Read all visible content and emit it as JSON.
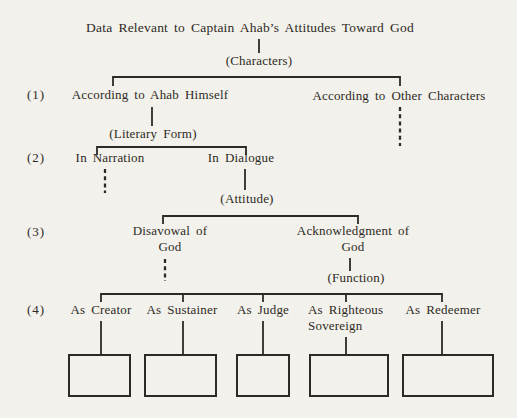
{
  "diagram": {
    "title": "Data Relevant to Captain Ahab’s Attitudes Toward God",
    "grouping_labels": {
      "characters": "(Characters)",
      "literary_form": "(Literary Form)",
      "attitude": "(Attitude)",
      "function": "(Function)"
    },
    "level_markers": [
      "(1)",
      "(2)",
      "(3)",
      "(4)"
    ],
    "level1": {
      "left": "According to Ahab Himself",
      "right": "According to Other Characters"
    },
    "level2": {
      "left": "In Narration",
      "right": "In Dialogue"
    },
    "level3": {
      "left": "Disavowal of God",
      "right": "Acknowledgment of God"
    },
    "level4": [
      "As Creator",
      "As Sustainer",
      "As Judge",
      "As Righteous Sovereign",
      "As Redeemer"
    ],
    "empty_box_count": 5,
    "colors": {
      "ink": "#2e2a23",
      "paper": "#f2f1ec"
    }
  }
}
